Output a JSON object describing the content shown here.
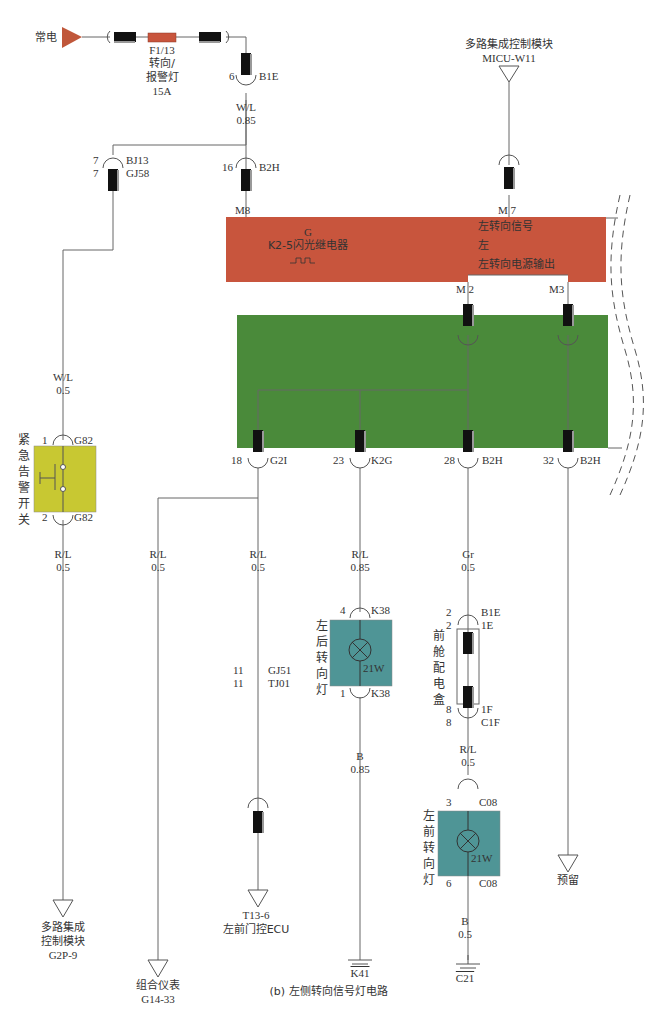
{
  "caption": "(b) 左侧转向信号灯电路",
  "colors": {
    "relay_box": "#c8553d",
    "junction_box": "#4a8a3a",
    "switch_box": "#c8c832",
    "lamp_box": "#4f9596",
    "source_triangle": "#c0573a",
    "wire": "#666666",
    "connector": "#111111"
  },
  "power_source": {
    "label": "常电"
  },
  "fuse": {
    "id": "F1/13",
    "name_line1": "转向/",
    "name_line2": "报警灯",
    "rating": "15A"
  },
  "connectors": {
    "b1e_top": {
      "pin": "6",
      "id": "B1E"
    },
    "bj13": {
      "pin": "7",
      "id": "BJ13"
    },
    "gj58": {
      "pin": "7",
      "id": "GJ58"
    },
    "b2h_top": {
      "pin": "16",
      "id": "B2H"
    },
    "g2i": {
      "pin": "18",
      "id": "G2I"
    },
    "k2g": {
      "pin": "23",
      "id": "K2G"
    },
    "b2h_28": {
      "pin": "28",
      "id": "B2H"
    },
    "b2h_32": {
      "pin": "32",
      "id": "B2H"
    },
    "g82_top": {
      "pin": "1",
      "id": "G82"
    },
    "g82_bot": {
      "pin": "2",
      "id": "G82"
    },
    "gj51": {
      "pin": "11",
      "id": "GJ51"
    },
    "tj01": {
      "pin": "11",
      "id": "TJ01"
    },
    "k38_top": {
      "pin": "4",
      "id": "K38"
    },
    "k38_bot": {
      "pin": "1",
      "id": "K38"
    },
    "b1e_fb": {
      "pin": "2",
      "id": "B1E"
    },
    "e1": {
      "pin": "2",
      "id": "1E"
    },
    "f1": {
      "pin": "8",
      "id": "1F"
    },
    "c1f": {
      "pin": "8",
      "id": "C1F"
    },
    "c08_top": {
      "pin": "3",
      "id": "C08"
    },
    "c08_bot": {
      "pin": "6",
      "id": "C08"
    }
  },
  "wires": {
    "w_main": {
      "color": "W/L",
      "gauge": "0.85"
    },
    "w_switch_in": {
      "color": "W/L",
      "gauge": "0.5"
    },
    "w_switch_out": {
      "color": "R/L",
      "gauge": "0.5"
    },
    "w_cluster": {
      "color": "R/L",
      "gauge": "0.5"
    },
    "w_door": {
      "color": "R/L",
      "gauge": "0.5"
    },
    "w_rear": {
      "color": "R/L",
      "gauge": "0.85"
    },
    "w_front_in": {
      "color": "Gr",
      "gauge": "0.5"
    },
    "w_rear_gnd": {
      "color": "B",
      "gauge": "0.85"
    },
    "w_front_mid": {
      "color": "R/L",
      "gauge": "0.5"
    },
    "w_front_gnd": {
      "color": "B",
      "gauge": "0.5"
    }
  },
  "micu": {
    "name": "多路集成控制模块",
    "id": "MICU-W11"
  },
  "relay": {
    "pin_m8": "M8",
    "pin_m7": "M 7",
    "pin_m2": "M 2",
    "pin_m3": "M3",
    "title_g": "G",
    "title": "K2-5闪光继电器",
    "signal_in": "左转向信号",
    "left": "左",
    "power_out": "左转向电源输出"
  },
  "hazard_switch": {
    "name": "紧急告警开关"
  },
  "rear_lamp": {
    "name": "左后转向灯",
    "power": "21W"
  },
  "front_lamp": {
    "name": "左前转向灯",
    "power": "21W"
  },
  "fuse_box_front": {
    "name": "前舱配电盒"
  },
  "destinations": {
    "micu_g2p": {
      "line1": "多路集成",
      "line2": "控制模块",
      "line3": "G2P-9"
    },
    "cluster": {
      "line1": "组合仪表",
      "line2": "G14-33"
    },
    "door_ecu": {
      "line1": "T13-6",
      "line2": "左前门控ECU"
    },
    "reserved": {
      "line1": "预留"
    }
  },
  "grounds": {
    "rear": "K41",
    "front": "C21"
  }
}
